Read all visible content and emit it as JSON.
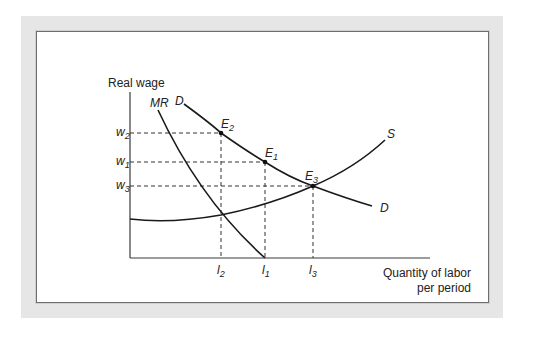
{
  "figure": {
    "y_axis_label": "Real wage",
    "x_axis_label_line1": "Quantity of labor",
    "x_axis_label_line2": "per period",
    "curves": {
      "mr": "MR",
      "d_top": "D",
      "d_end": "D",
      "s": "S"
    },
    "points": {
      "e2": {
        "base": "E",
        "sub": "2"
      },
      "e1": {
        "base": "E",
        "sub": "1"
      },
      "e3": {
        "base": "E",
        "sub": "3"
      }
    },
    "y_ticks": [
      {
        "base": "w",
        "sub": "2"
      },
      {
        "base": "w",
        "sub": "1"
      },
      {
        "base": "w",
        "sub": "3"
      }
    ],
    "x_ticks": [
      {
        "base": "l",
        "sub": "2"
      },
      {
        "base": "l",
        "sub": "1"
      },
      {
        "base": "l",
        "sub": "3"
      }
    ],
    "colors": {
      "frame": "#e6e6e6",
      "border": "#6e6e6e",
      "line": "#1a1a1a"
    }
  }
}
